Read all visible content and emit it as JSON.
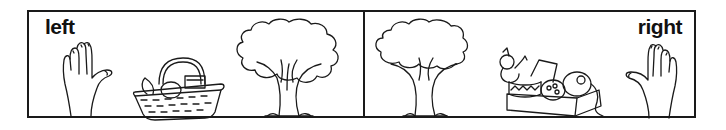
{
  "worksheet": {
    "panels": [
      {
        "side": "left",
        "label": "left",
        "items": [
          "left-hand",
          "picnic-basket",
          "tree"
        ]
      },
      {
        "side": "right",
        "label": "right",
        "items": [
          "tree",
          "toy-box",
          "right-hand"
        ]
      }
    ],
    "colors": {
      "ink": "#1a1a1a",
      "background": "#ffffff"
    }
  }
}
